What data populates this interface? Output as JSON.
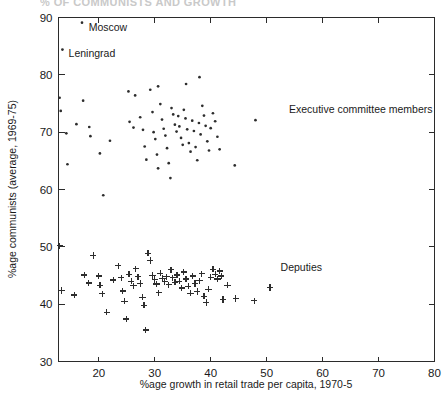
{
  "figure": {
    "clipped_title": "% OF COMMUNISTS AND GROWTH",
    "background": "#ffffff",
    "ink": "#2d2d2d"
  },
  "chart_data": {
    "type": "scatter",
    "title": "",
    "xlabel": "%age growth in retail trade per capita, 1970-5",
    "ylabel": "%age communists (average, 1969-75)",
    "xlim": [
      12.8,
      80
    ],
    "ylim": [
      30,
      90
    ],
    "xticks": [
      20,
      30,
      40,
      50,
      60,
      70,
      80
    ],
    "yticks": [
      30,
      40,
      50,
      60,
      70,
      80,
      90
    ],
    "grid": false,
    "legend": "none",
    "annotations": [
      {
        "text": "Moscow",
        "x": 18.2,
        "y": 87.6,
        "anchor": "start"
      },
      {
        "text": "Leningrad",
        "x": 14.6,
        "y": 83.2,
        "anchor": "start"
      },
      {
        "text": "Executive committee members",
        "x": 54.0,
        "y": 73.4,
        "anchor": "start"
      },
      {
        "text": "Deputies",
        "x": 52.5,
        "y": 45.8,
        "anchor": "start"
      }
    ],
    "series": [
      {
        "name": "Executive committee members",
        "marker": "dot",
        "points": [
          [
            17.0,
            89.1
          ],
          [
            13.5,
            84.4
          ],
          [
            13.0,
            76.0
          ],
          [
            13.2,
            73.7
          ],
          [
            14.2,
            69.8
          ],
          [
            14.4,
            64.4
          ],
          [
            16.0,
            71.4
          ],
          [
            17.2,
            75.5
          ],
          [
            18.3,
            70.9
          ],
          [
            18.5,
            69.3
          ],
          [
            20.2,
            66.3
          ],
          [
            20.8,
            59.0
          ],
          [
            22.0,
            68.5
          ],
          [
            25.3,
            77.1
          ],
          [
            25.5,
            71.8
          ],
          [
            26.2,
            70.8
          ],
          [
            26.5,
            76.4
          ],
          [
            27.4,
            72.6
          ],
          [
            27.9,
            70.4
          ],
          [
            28.2,
            67.5
          ],
          [
            28.5,
            65.2
          ],
          [
            29.2,
            77.4
          ],
          [
            29.6,
            73.5
          ],
          [
            29.8,
            70.0
          ],
          [
            30.1,
            68.8
          ],
          [
            30.4,
            66.1
          ],
          [
            30.6,
            63.7
          ],
          [
            31.0,
            74.9
          ],
          [
            31.3,
            72.2
          ],
          [
            31.6,
            70.6
          ],
          [
            31.9,
            69.4
          ],
          [
            32.2,
            67.2
          ],
          [
            32.5,
            64.6
          ],
          [
            32.8,
            62.0
          ],
          [
            33.0,
            74.2
          ],
          [
            33.3,
            73.1
          ],
          [
            33.6,
            71.3
          ],
          [
            33.9,
            70.1
          ],
          [
            34.2,
            72.8
          ],
          [
            34.4,
            71.0
          ],
          [
            34.7,
            69.0
          ],
          [
            35.0,
            67.8
          ],
          [
            35.2,
            73.9
          ],
          [
            35.5,
            72.4
          ],
          [
            35.8,
            70.5
          ],
          [
            36.1,
            68.1
          ],
          [
            36.4,
            66.6
          ],
          [
            36.7,
            72.0
          ],
          [
            37.0,
            70.2
          ],
          [
            37.3,
            67.4
          ],
          [
            37.6,
            65.1
          ],
          [
            37.9,
            71.6
          ],
          [
            38.2,
            69.6
          ],
          [
            38.5,
            74.6
          ],
          [
            38.8,
            72.9
          ],
          [
            39.1,
            71.1
          ],
          [
            39.4,
            68.4
          ],
          [
            39.7,
            66.8
          ],
          [
            40.0,
            70.7
          ],
          [
            40.4,
            73.3
          ],
          [
            40.8,
            71.9
          ],
          [
            41.2,
            69.2
          ],
          [
            41.6,
            67.0
          ],
          [
            38.0,
            79.6
          ],
          [
            35.6,
            78.4
          ],
          [
            30.6,
            78.0
          ],
          [
            44.3,
            64.2
          ],
          [
            48.0,
            72.1
          ]
        ]
      },
      {
        "name": "Deputies",
        "marker": "plus",
        "points": [
          [
            13.0,
            50.2
          ],
          [
            13.4,
            42.4
          ],
          [
            15.6,
            41.6
          ],
          [
            17.4,
            45.1
          ],
          [
            18.2,
            43.7
          ],
          [
            19.0,
            48.5
          ],
          [
            20.0,
            44.9
          ],
          [
            20.2,
            43.3
          ],
          [
            20.6,
            41.8
          ],
          [
            21.4,
            38.6
          ],
          [
            22.6,
            44.2
          ],
          [
            23.5,
            46.7
          ],
          [
            24.0,
            44.6
          ],
          [
            24.3,
            42.3
          ],
          [
            24.6,
            40.5
          ],
          [
            24.9,
            37.4
          ],
          [
            25.4,
            45.2
          ],
          [
            25.8,
            44.0
          ],
          [
            26.2,
            43.2
          ],
          [
            26.6,
            46.2
          ],
          [
            27.0,
            44.8
          ],
          [
            27.4,
            43.6
          ],
          [
            27.8,
            41.2
          ],
          [
            28.1,
            39.8
          ],
          [
            28.4,
            35.5
          ],
          [
            28.8,
            48.9
          ],
          [
            29.2,
            47.6
          ],
          [
            29.6,
            45.0
          ],
          [
            30.0,
            44.3
          ],
          [
            30.3,
            43.5
          ],
          [
            30.7,
            42.0
          ],
          [
            31.0,
            45.4
          ],
          [
            31.4,
            44.5
          ],
          [
            31.8,
            43.9
          ],
          [
            32.1,
            44.8
          ],
          [
            32.5,
            43.4
          ],
          [
            32.9,
            46.0
          ],
          [
            33.2,
            44.6
          ],
          [
            33.6,
            43.8
          ],
          [
            34.0,
            45.1
          ],
          [
            34.4,
            44.0
          ],
          [
            34.8,
            42.8
          ],
          [
            35.2,
            45.6
          ],
          [
            35.6,
            44.4
          ],
          [
            36.0,
            43.1
          ],
          [
            36.4,
            41.9
          ],
          [
            36.8,
            44.9
          ],
          [
            37.2,
            43.6
          ],
          [
            37.6,
            42.2
          ],
          [
            38.0,
            44.1
          ],
          [
            38.4,
            45.3
          ],
          [
            38.8,
            41.4
          ],
          [
            39.2,
            40.3
          ],
          [
            39.6,
            42.6
          ],
          [
            40.0,
            44.7
          ],
          [
            40.4,
            46.1
          ],
          [
            40.8,
            45.2
          ],
          [
            41.2,
            44.4
          ],
          [
            41.6,
            45.8
          ],
          [
            41.9,
            44.9
          ],
          [
            42.2,
            40.8
          ],
          [
            43.0,
            43.3
          ],
          [
            44.5,
            41.0
          ],
          [
            47.8,
            40.6
          ],
          [
            50.6,
            42.9
          ]
        ]
      }
    ]
  }
}
